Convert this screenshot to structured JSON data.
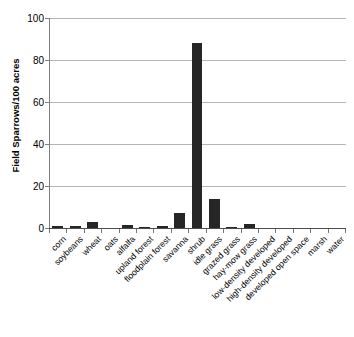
{
  "chart_data": {
    "type": "bar",
    "title": "",
    "xlabel": "",
    "ylabel": "Field Sparrows/100 acres",
    "ylim": [
      0,
      100
    ],
    "yticks": [
      0,
      20,
      40,
      60,
      80,
      100
    ],
    "grid": true,
    "legend": false,
    "bar_color": "#262626",
    "categories": [
      "corn",
      "soybeans",
      "wheat",
      "oats",
      "alfalfa",
      "upland forest",
      "floodplain forest",
      "savanna",
      "shrub",
      "idle grass",
      "grazed grass",
      "hay-mow grass",
      "low-density developed",
      "high-density developed",
      "developed open space",
      "marsh",
      "water"
    ],
    "values": [
      1,
      1,
      3,
      0,
      1.2,
      0.6,
      0.8,
      7,
      88,
      14,
      0.6,
      2,
      0,
      0,
      0,
      0,
      0
    ]
  }
}
